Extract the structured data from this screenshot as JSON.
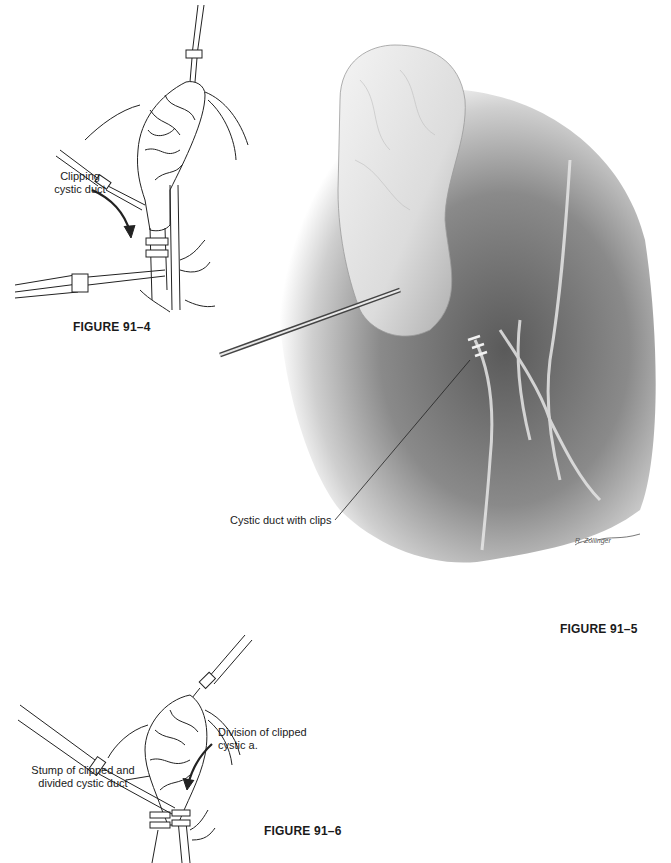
{
  "page": {
    "background": "#ffffff"
  },
  "figures": [
    {
      "id": "91-4",
      "caption": "FIGURE 91–4",
      "style": "line-drawing",
      "labels": [
        {
          "text_line1": "Clipping",
          "text_line2": "cystic duct"
        }
      ]
    },
    {
      "id": "91-5",
      "caption": "FIGURE 91–5",
      "style": "shaded-pencil-illustration",
      "labels": [
        {
          "text": "Cystic duct with clips"
        }
      ],
      "signature": "R. Zollinger"
    },
    {
      "id": "91-6",
      "caption": "FIGURE 91–6",
      "style": "line-drawing",
      "labels": [
        {
          "text_line1": "Division of clipped",
          "text_line2": "cystic a."
        },
        {
          "text_line1": "Stump of clipped and",
          "text_line2": "divided cystic duct"
        }
      ]
    }
  ]
}
